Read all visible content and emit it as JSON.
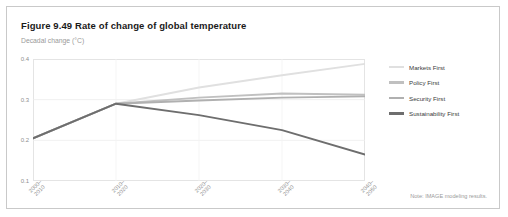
{
  "figure": {
    "title": "Figure 9.49 Rate of change of global temperature",
    "subtitle": "Decadal change (°C)",
    "note": "Note: IMAGE modeling results."
  },
  "chart_data": {
    "type": "line",
    "title": "Figure 9.49 Rate of change of global temperature",
    "xlabel": "",
    "ylabel": "Decadal change (°C)",
    "categories": [
      "2000–2010",
      "2010–2020",
      "2020–2030",
      "2030–2040",
      "2040–2050"
    ],
    "category_lines": [
      [
        "2000–",
        "2010"
      ],
      [
        "2010–",
        "2020"
      ],
      [
        "2020–",
        "2030"
      ],
      [
        "2030–",
        "2040"
      ],
      [
        "2040–",
        "2050"
      ]
    ],
    "ylim": [
      0.1,
      0.4
    ],
    "yticks": [
      0.4,
      0.3,
      0.2,
      0.1
    ],
    "ytick_labels": [
      "0.4",
      "0.3",
      "0.2",
      "0.1"
    ],
    "grid": true,
    "legend_position": "right",
    "series": [
      {
        "name": "Markets First",
        "color": "#e0e0e0",
        "values": [
          0.205,
          0.29,
          0.33,
          0.36,
          0.388
        ]
      },
      {
        "name": "Policy First",
        "color": "#c0c0c0",
        "values": [
          0.205,
          0.29,
          0.305,
          0.315,
          0.312
        ]
      },
      {
        "name": "Security First",
        "color": "#b0b0b0",
        "values": [
          0.205,
          0.29,
          0.298,
          0.305,
          0.308
        ]
      },
      {
        "name": "Sustainability First",
        "color": "#6e6e6e",
        "values": [
          0.205,
          0.29,
          0.262,
          0.225,
          0.165
        ]
      }
    ]
  },
  "legend": {
    "items": [
      {
        "label": "Markets First"
      },
      {
        "label": "Policy First"
      },
      {
        "label": "Security First"
      },
      {
        "label": "Sustainability First"
      }
    ]
  }
}
